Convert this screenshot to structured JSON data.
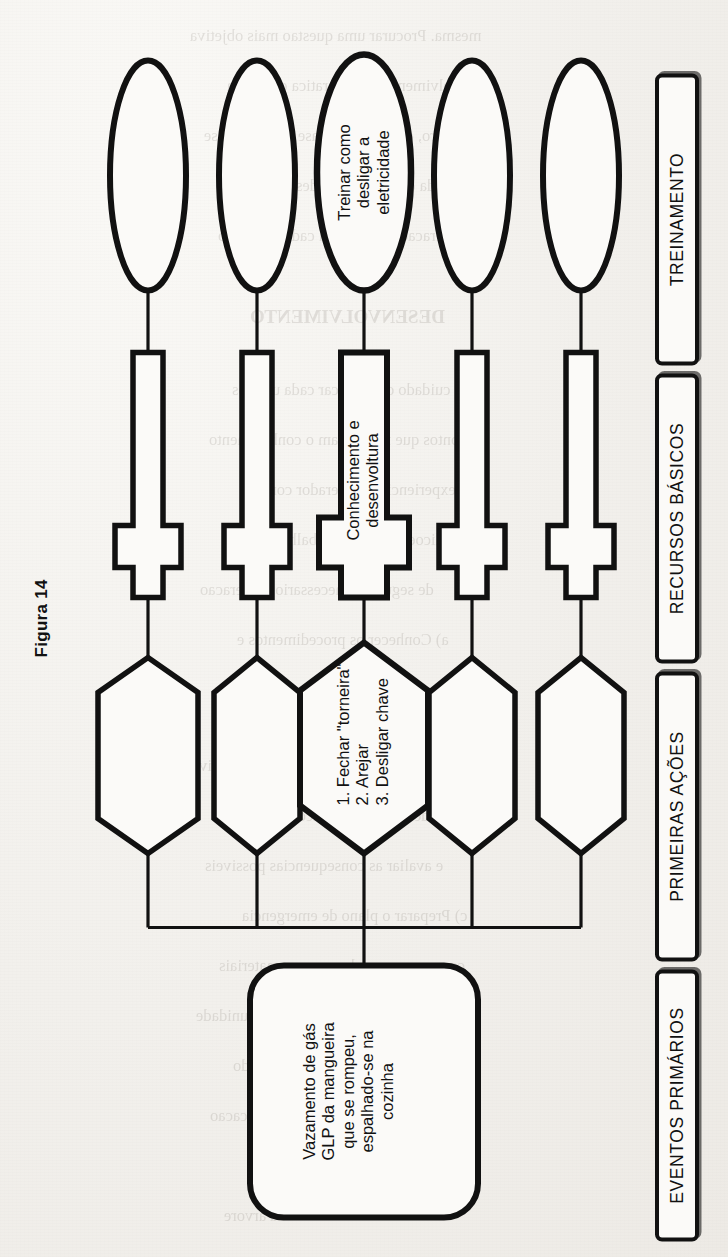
{
  "figure": {
    "caption": "Figura 14",
    "stages": [
      {
        "id": "eventos-primarios",
        "label": "EVENTOS PRIMÁRIOS"
      },
      {
        "id": "primeiras-acoes",
        "label": "PRIMEIRAS AÇÕES"
      },
      {
        "id": "recursos-basicos",
        "label": "RECURSOS BÁSICOS"
      },
      {
        "id": "treinamento",
        "label": "TREINAMENTO"
      }
    ],
    "nodes": {
      "primary_event": {
        "shape": "rounded-rectangle",
        "text": "Vazamento de gás\nGLP da mangueira\nque se rompeu,\nespalhado-se na\ncozinha"
      },
      "actions": [
        {
          "shape": "hexagon",
          "text": "1. Fechar \"torneira\"\n2. Arejar\n3. Desligar chave"
        },
        {
          "shape": "hexagon",
          "text": ""
        },
        {
          "shape": "hexagon",
          "text": ""
        },
        {
          "shape": "hexagon",
          "text": ""
        },
        {
          "shape": "hexagon",
          "text": ""
        }
      ],
      "resources": [
        {
          "shape": "notched-rectangle",
          "text": "Conhecimento e\ndesenvoltura"
        },
        {
          "shape": "notched-rectangle",
          "text": ""
        },
        {
          "shape": "notched-rectangle",
          "text": ""
        },
        {
          "shape": "notched-rectangle",
          "text": ""
        },
        {
          "shape": "notched-rectangle",
          "text": ""
        }
      ],
      "training": [
        {
          "shape": "ellipse",
          "text": "Treinar como\ndesligar a\neletricidade"
        },
        {
          "shape": "ellipse",
          "text": ""
        },
        {
          "shape": "ellipse",
          "text": ""
        },
        {
          "shape": "ellipse",
          "text": ""
        },
        {
          "shape": "ellipse",
          "text": ""
        }
      ]
    },
    "colors": {
      "ink": "#111111",
      "paper": "#f4f2ef",
      "shape_fill": "#fbfaf8"
    }
  },
  "bleed_through": {
    "note": "faint reversed text showing through from the opposite page side",
    "lines": [
      "mesma. Procurar uma questao mais objetiva",
      "e envolvimento com a pratica cotidiana",
      "outro, que serve de base para a analise",
      "detalhada das possibilidades reais de",
      "consideracao do risco em cada momento",
      "DESENVOLVIMENTO",
      "o cuidado de verificar cada um dos",
      "pontos que relacionam o conhecimento",
      "e a experiencia do operador com as",
      "condicoes gerais de trabalho e o grau",
      "de seguranca necessario a operacao",
      "a) Conhecer os procedimentos e",
      "responsabilidades de cada um dos",
      "envolvidos no processo produtivo",
      "b) Identificar as situacoes de risco",
      "e avaliar as consequencias possiveis",
      "c) Preparar o plano de emergencia",
      "com os recursos humanos e materiais",
      "disponiveis na unidade",
      "Nota: o esquema da figura ao lado",
      "mostra um exemplo de aplicacao",
      "da proposta de leitura sistematica",
      "da arvore"
    ]
  }
}
